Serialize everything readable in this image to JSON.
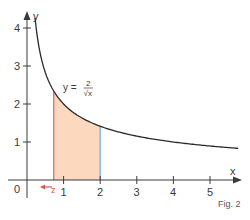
{
  "figure": {
    "caption": "Fig. 2",
    "equation": {
      "lhs": "y =",
      "numerator": "2",
      "denominator": "√x"
    }
  },
  "chart_data": {
    "type": "area",
    "title": "",
    "function": "y = 2/sqrt(x)",
    "xlabel": "x",
    "ylabel": "y",
    "xlim": [
      0,
      5.8
    ],
    "ylim": [
      0,
      4.3
    ],
    "x_ticks": [
      "1",
      "2",
      "3",
      "4",
      "5"
    ],
    "y_ticks": [
      "1",
      "2",
      "3",
      "4"
    ],
    "origin_label": "0",
    "grid": false,
    "curve_points": [
      {
        "x": 0.22,
        "y": 4.26
      },
      {
        "x": 0.25,
        "y": 4.0
      },
      {
        "x": 0.5,
        "y": 2.83
      },
      {
        "x": 0.73,
        "y": 2.34
      },
      {
        "x": 1,
        "y": 2.0
      },
      {
        "x": 1.5,
        "y": 1.63
      },
      {
        "x": 2,
        "y": 1.41
      },
      {
        "x": 3,
        "y": 1.15
      },
      {
        "x": 4,
        "y": 1.0
      },
      {
        "x": 5,
        "y": 0.89
      },
      {
        "x": 5.77,
        "y": 0.83
      }
    ],
    "shaded_region": {
      "from": "z",
      "from_value": 0.73,
      "to": 2,
      "fill": "#fcd8bf"
    },
    "markers": [
      {
        "label": "z",
        "x": 0.73,
        "color": "#e8605a",
        "arrow": "left"
      },
      {
        "label": "",
        "x": 2,
        "color": "#6ab0d8"
      }
    ]
  },
  "colors": {
    "axis": "#3a3a3a",
    "curve": "#2a2a2a",
    "fill": "#fcd8bf",
    "left_bound": "#e8605a",
    "right_bound": "#6ab0d8"
  }
}
